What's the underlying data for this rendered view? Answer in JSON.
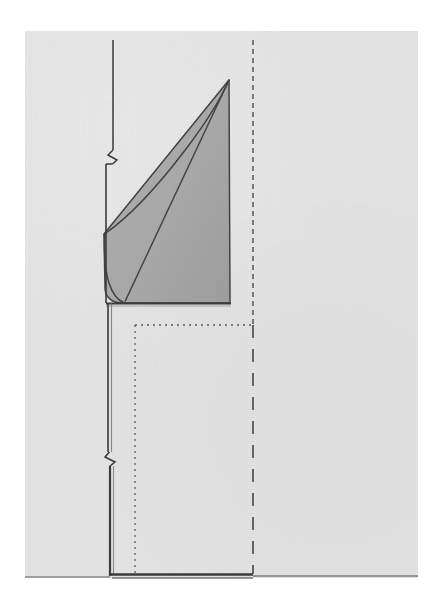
{
  "document": {
    "kind": "scanned-technical-drawing",
    "caption": "",
    "page_background_color": "#e3e3e3",
    "canvas_background_color": "#ffffff",
    "ink_color": "#3b3b3b",
    "shaded_region_fill_color": "#a8a8a8",
    "shaded_region_stroke_color": "#43433f",
    "dashed_line_color": "#5a5a5a"
  },
  "page": {
    "left": 25,
    "top": 31,
    "width": 393,
    "height": 547
  },
  "labels": {
    "title": "",
    "figure_number": "",
    "annotations": []
  },
  "geometry": {
    "upper_vertical_axis": {
      "name": "upper-vertical-axis",
      "x": 113,
      "y_top": 40,
      "y_bottom": 303,
      "break_mark_y": 155,
      "stroke_width": 1.5
    },
    "lower_vertical_axis": {
      "name": "lower-vertical-axis",
      "x": 112,
      "y_top": 303,
      "y_bottom": 575,
      "break_mark_y": 458,
      "stroke_width": 2.6
    },
    "baseline_horizontal": {
      "name": "baseline",
      "y": 575,
      "x_left": 112,
      "x_right_thick": 253,
      "x_right_thin": 418,
      "stroke_width_thick": 3.0,
      "stroke_width_thin": 1.2
    },
    "shoulder_horizontal": {
      "name": "shoulder",
      "y": 303,
      "x_left": 106,
      "x_right": 231
    },
    "shaded_region": {
      "name": "shaded-stress-wedge",
      "apex": {
        "x": 229,
        "y": 80
      },
      "left_vertex": {
        "x": 104,
        "y": 234
      },
      "bottom_right": {
        "x": 230,
        "y": 303
      },
      "bottom_left": {
        "x": 122,
        "y": 303
      },
      "fill": "#a8a8a8"
    },
    "dotted_guide": {
      "name": "fine-dotted-guide",
      "corner_x": 135,
      "corner_y": 325,
      "x_right": 253,
      "y_bottom": 575,
      "dash_pattern": "2 4",
      "stroke_width": 1.3
    },
    "dashed_guide": {
      "name": "coarse-dashed-guide",
      "x": 253,
      "y_top": 40,
      "y_bottom": 575,
      "upper_dash_pattern": "5 4",
      "lower_dash_pattern": "13 11",
      "stroke_width": 1.6,
      "transition_y": 325
    }
  }
}
